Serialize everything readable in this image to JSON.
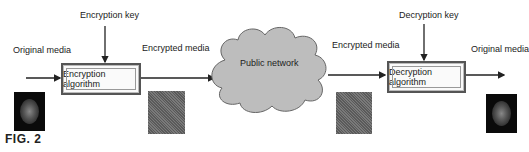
{
  "figure": {
    "caption": "FIG. 2",
    "labels": {
      "original_media_left": "Original media",
      "encryption_key": "Encryption key",
      "encrypted_media_left": "Encrypted media",
      "public_network": "Public network",
      "encrypted_media_right": "Encrypted media",
      "decryption_key": "Decryption key",
      "original_media_right": "Original media"
    },
    "boxes": {
      "encryption": "Encryption algorithm",
      "decryption": "Decryption algorithm"
    }
  }
}
